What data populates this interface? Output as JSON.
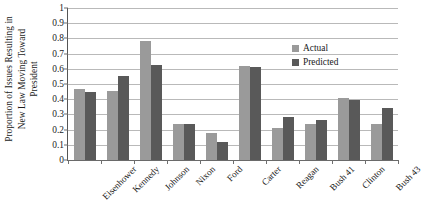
{
  "chart_data": {
    "type": "bar",
    "title": "",
    "xlabel": "",
    "ylabel": "Proportion of Issues Resulting in\nNew Law Moving Toward\nPresident",
    "ylim": [
      0,
      1
    ],
    "ytick_labels": [
      "0",
      "0.1",
      "0.2",
      "0.3",
      "0.4",
      "0.5",
      "0.6",
      "0.7",
      "0.8",
      "0.9",
      "1"
    ],
    "ytick_values": [
      0,
      0.1,
      0.2,
      0.3,
      0.4,
      0.5,
      0.6,
      0.7,
      0.8,
      0.9,
      1
    ],
    "grid": true,
    "grid_axis": "y",
    "legend_position": "top-right",
    "categories": [
      "Eisenhower",
      "Kennedy",
      "Johnson",
      "Nixon",
      "Ford",
      "Carter",
      "Reagan",
      "Bush 41",
      "Clinton",
      "Bush 43"
    ],
    "series": [
      {
        "name": "Actual",
        "color": "#9a9a9a",
        "values": [
          0.47,
          0.455,
          0.785,
          0.235,
          0.175,
          0.62,
          0.21,
          0.235,
          0.41,
          0.24
        ]
      },
      {
        "name": "Predicted",
        "color": "#595959",
        "values": [
          0.445,
          0.55,
          0.625,
          0.24,
          0.12,
          0.61,
          0.28,
          0.26,
          0.395,
          0.34
        ]
      }
    ]
  },
  "legend": {
    "items": [
      {
        "label": "Actual",
        "color": "#9a9a9a"
      },
      {
        "label": "Predicted",
        "color": "#595959"
      }
    ]
  }
}
